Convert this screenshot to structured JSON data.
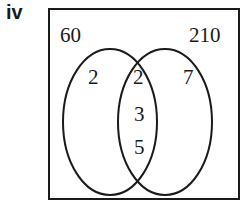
{
  "part_label": "iv",
  "diagram": {
    "type": "venn",
    "universal_set": {
      "corner_left_value": "60",
      "corner_right_value": "210"
    },
    "regions": {
      "left_only": [
        "2"
      ],
      "intersection": [
        "2",
        "3",
        "5"
      ],
      "right_only": [
        "7"
      ]
    },
    "colors": {
      "stroke": "#1a1a1a",
      "background": "#ffffff"
    }
  }
}
